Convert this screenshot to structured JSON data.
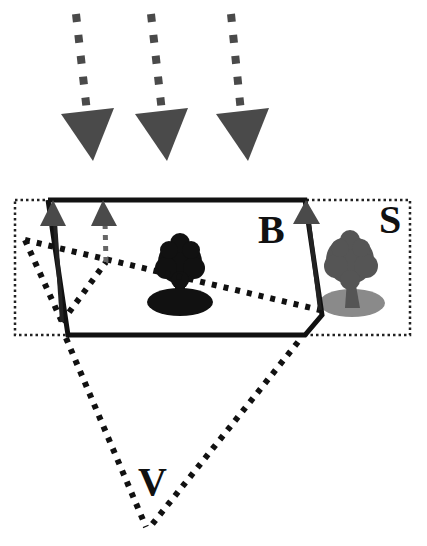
{
  "diagram": {
    "labels": {
      "building": "B",
      "scene": "S",
      "view": "V"
    },
    "colors": {
      "background": "#ffffff",
      "arrow_gray": "#4a4a4a",
      "line_black": "#111111",
      "tree_building": "#111111",
      "tree_scene": "#555555",
      "ground_scene": "#8a8a8a"
    },
    "elements": {
      "incoming_arrows": 3,
      "reflected_arrows": 3,
      "trees": [
        "tree-inside-building",
        "tree-in-scene"
      ]
    }
  }
}
